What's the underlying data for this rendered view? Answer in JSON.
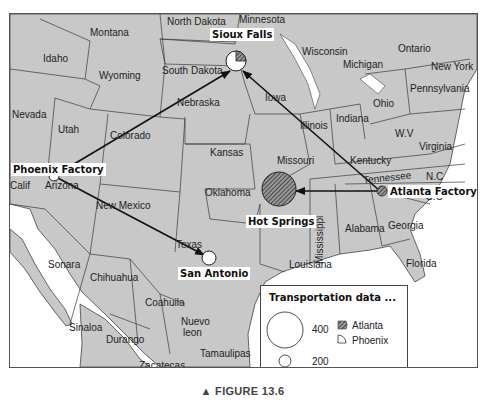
{
  "figure": {
    "caption": "▲ FIGURE 13.6"
  },
  "map": {
    "region_labels": [
      {
        "name": "Montana",
        "x": 80,
        "y": 14
      },
      {
        "name": "North Dakota",
        "x": 157,
        "y": 3
      },
      {
        "name": "Minnesota",
        "x": 229,
        "y": 1
      },
      {
        "name": "Idaho",
        "x": 33,
        "y": 40
      },
      {
        "name": "Wyoming",
        "x": 89,
        "y": 57
      },
      {
        "name": "South Dakota",
        "x": 152,
        "y": 52
      },
      {
        "name": "Wisconsin",
        "x": 292,
        "y": 33
      },
      {
        "name": "Michigan",
        "x": 333,
        "y": 46
      },
      {
        "name": "Ontario",
        "x": 388,
        "y": 30
      },
      {
        "name": "New York",
        "x": 421,
        "y": 48
      },
      {
        "name": "Nevada",
        "x": 2,
        "y": 96
      },
      {
        "name": "Utah",
        "x": 48,
        "y": 111
      },
      {
        "name": "Colorado",
        "x": 100,
        "y": 117
      },
      {
        "name": "Nebraska",
        "x": 167,
        "y": 84
      },
      {
        "name": "Iowa",
        "x": 255,
        "y": 79
      },
      {
        "name": "Illinois",
        "x": 290,
        "y": 107
      },
      {
        "name": "Indiana",
        "x": 326,
        "y": 100
      },
      {
        "name": "Ohio",
        "x": 363,
        "y": 85
      },
      {
        "name": "Pennsylvania",
        "x": 400,
        "y": 70
      },
      {
        "name": "W.V",
        "x": 385,
        "y": 115
      },
      {
        "name": "Virginia",
        "x": 409,
        "y": 128
      },
      {
        "name": "Kansas",
        "x": 200,
        "y": 134
      },
      {
        "name": "Missouri",
        "x": 267,
        "y": 142
      },
      {
        "name": "Kentucky",
        "x": 340,
        "y": 142
      },
      {
        "name": "Tennessee",
        "x": 353,
        "y": 159
      },
      {
        "name": "N.C",
        "x": 416,
        "y": 158
      },
      {
        "name": "S.C",
        "x": 416,
        "y": 178
      },
      {
        "name": "Calif",
        "x": 0,
        "y": 167
      },
      {
        "name": "Arizona",
        "x": 35,
        "y": 167
      },
      {
        "name": "New Mexico",
        "x": 86,
        "y": 187
      },
      {
        "name": "Oklahoma",
        "x": 195,
        "y": 174
      },
      {
        "name": "Mississippi",
        "x": 305,
        "y": 210
      },
      {
        "name": "Alabama",
        "x": 335,
        "y": 210
      },
      {
        "name": "Georgia",
        "x": 378,
        "y": 207
      },
      {
        "name": "Texas",
        "x": 166,
        "y": 226
      },
      {
        "name": "Louisiana",
        "x": 279,
        "y": 246
      },
      {
        "name": "Florida",
        "x": 396,
        "y": 245
      },
      {
        "name": "Sonara",
        "x": 38,
        "y": 246
      },
      {
        "name": "Chihuahua",
        "x": 80,
        "y": 259
      },
      {
        "name": "Coahuila",
        "x": 135,
        "y": 284
      },
      {
        "name": "Sinaloa",
        "x": 59,
        "y": 309
      },
      {
        "name": "Nuevo",
        "x": 171,
        "y": 303
      },
      {
        "name": "leon",
        "x": 173,
        "y": 314
      },
      {
        "name": "Durango",
        "x": 96,
        "y": 321
      },
      {
        "name": "Tamaulipas",
        "x": 190,
        "y": 335
      },
      {
        "name": "Zacatecas",
        "x": 129,
        "y": 347
      },
      {
        "name": "Nayarit",
        "x": 84,
        "y": 355
      }
    ],
    "locations": {
      "sioux_falls": {
        "label": "Sioux Falls",
        "type": "destination"
      },
      "phoenix_factory": {
        "label": "Phoenix Factory",
        "type": "origin"
      },
      "atlanta_factory": {
        "label": "Atlanta Factory",
        "type": "origin"
      },
      "hot_springs": {
        "label": "Hot Springs",
        "type": "destination"
      },
      "san_antonio": {
        "label": "San Antonio",
        "type": "destination"
      }
    },
    "flows": [
      {
        "from": "Phoenix Factory",
        "to": "Sioux Falls"
      },
      {
        "from": "Phoenix Factory",
        "to": "San Antonio"
      },
      {
        "from": "Atlanta Factory",
        "to": "Sioux Falls"
      },
      {
        "from": "Atlanta Factory",
        "to": "Hot Springs"
      }
    ],
    "colors": {
      "land": "#c8c8c8",
      "water": "#ffffff",
      "border": "#3a3a3a",
      "arrow": "#1a1a1a",
      "atlanta_hatch": "#555555",
      "phoenix_fill": "#ffffff"
    }
  },
  "legend": {
    "title": "Transportation data ...",
    "size_values": [
      "400",
      "200",
      "0"
    ],
    "series": [
      {
        "name": "Atlanta",
        "pattern": "hatched"
      },
      {
        "name": "Phoenix",
        "pattern": "white"
      }
    ]
  }
}
